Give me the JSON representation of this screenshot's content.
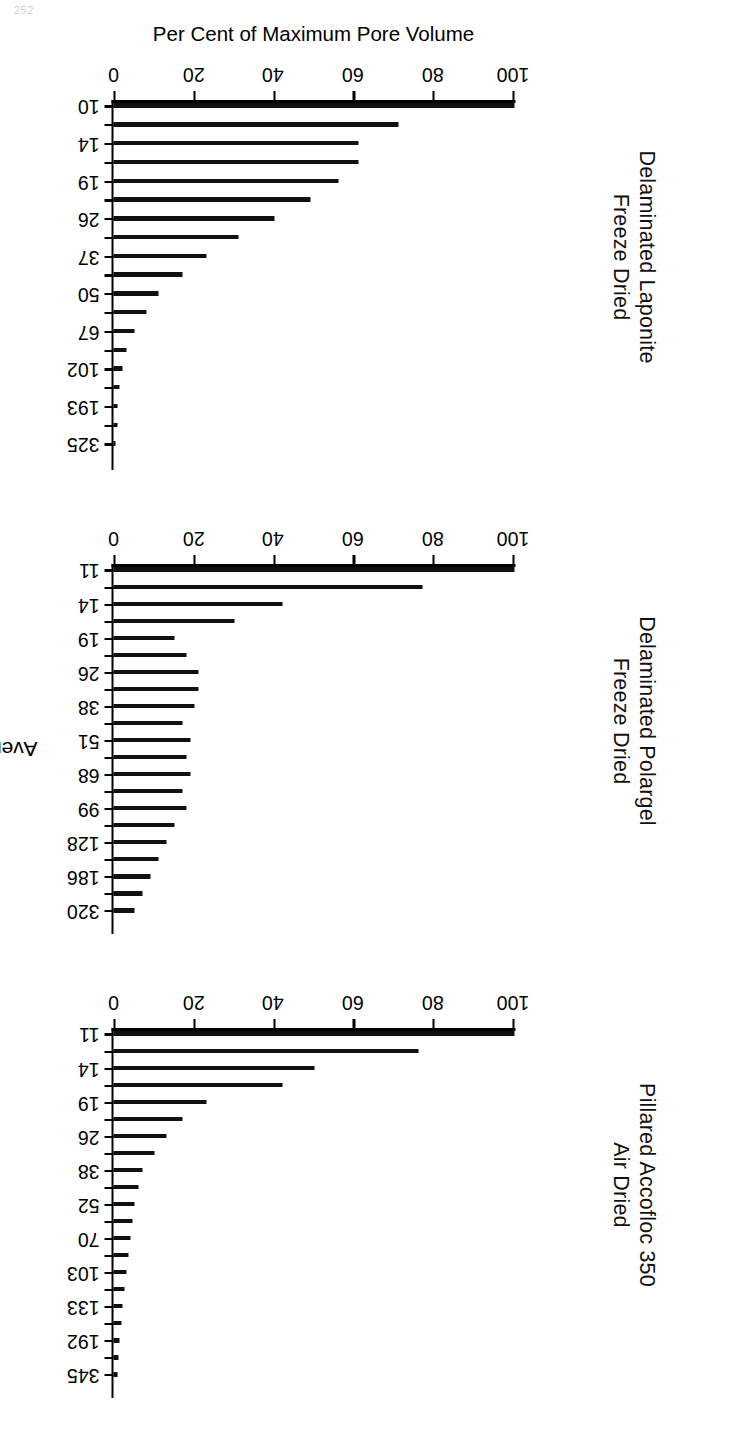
{
  "page": {
    "folio": "252"
  },
  "figure": {
    "x_axis_title": "Average Pore Diameter (Å)",
    "y_axis_title": "Per Cent of Maximum Pore Volume",
    "y_ticks": [
      "0",
      "20",
      "40",
      "60",
      "80",
      "100"
    ]
  },
  "chart_data": [
    {
      "type": "bar",
      "title": "Delaminated Laponite",
      "subtitle": "Freeze Dried",
      "xlabel": "Average Pore Diameter (Å)",
      "ylabel": "Per Cent of Maximum Pore Volume",
      "ylim": [
        0,
        100
      ],
      "yticks": [
        0,
        20,
        40,
        60,
        80,
        100
      ],
      "grid": false,
      "legend": "none",
      "orientation": "vertical-bars",
      "categories": [
        "10",
        "",
        "14",
        "",
        "19",
        "",
        "26",
        "",
        "37",
        "",
        "50",
        "",
        "67",
        "",
        "102",
        "",
        "193",
        "",
        "325"
      ],
      "tick_labels": [
        "10",
        "14",
        "19",
        "26",
        "37",
        "50",
        "67",
        "102",
        "193",
        "325"
      ],
      "tick_label_positions": [
        0,
        2,
        4,
        6,
        8,
        10,
        12,
        14,
        16,
        18
      ],
      "values": [
        100,
        71,
        61,
        61,
        56,
        49,
        40,
        31,
        23,
        17,
        11,
        8,
        5,
        3,
        2,
        1.5,
        1,
        1,
        0.5
      ]
    },
    {
      "type": "bar",
      "title": "Delaminated Polargel",
      "subtitle": "Freeze Dried",
      "xlabel": "Average Pore Diameter (Å)",
      "ylabel": "Per Cent of Maximum Pore Volume",
      "ylim": [
        0,
        100
      ],
      "yticks": [
        0,
        20,
        40,
        60,
        80,
        100
      ],
      "grid": false,
      "legend": "none",
      "orientation": "vertical-bars",
      "categories": [
        "11",
        "",
        "14",
        "",
        "19",
        "",
        "26",
        "",
        "38",
        "",
        "51",
        "",
        "68",
        "",
        "99",
        "",
        "128",
        "",
        "186",
        "",
        "320"
      ],
      "tick_labels": [
        "11",
        "14",
        "19",
        "26",
        "38",
        "51",
        "68",
        "99",
        "128",
        "186",
        "320"
      ],
      "tick_label_positions": [
        0,
        2,
        4,
        6,
        8,
        10,
        12,
        14,
        16,
        18,
        20
      ],
      "values": [
        100,
        77,
        42,
        30,
        15,
        18,
        21,
        21,
        20,
        17,
        19,
        18,
        19,
        17,
        18,
        15,
        13,
        11,
        9,
        7,
        5
      ]
    },
    {
      "type": "bar",
      "title": "Pillared Accofloc 350",
      "subtitle": "Air Dried",
      "xlabel": "Average Pore Diameter (Å)",
      "ylabel": "Per Cent of Maximum Pore Volume",
      "ylim": [
        0,
        100
      ],
      "yticks": [
        0,
        20,
        40,
        60,
        80,
        100
      ],
      "grid": false,
      "legend": "none",
      "orientation": "vertical-bars",
      "categories": [
        "11",
        "",
        "14",
        "",
        "19",
        "",
        "26",
        "",
        "38",
        "",
        "52",
        "",
        "70",
        "",
        "103",
        "",
        "133",
        "",
        "192",
        "",
        "345"
      ],
      "tick_labels": [
        "11",
        "14",
        "19",
        "26",
        "38",
        "52",
        "70",
        "103",
        "133",
        "192",
        "345"
      ],
      "tick_label_positions": [
        0,
        2,
        4,
        6,
        8,
        10,
        12,
        14,
        16,
        18,
        20
      ],
      "values": [
        100,
        76,
        50,
        42,
        23,
        17,
        13,
        10,
        7,
        6,
        5,
        4.5,
        4,
        3.5,
        3,
        2.5,
        2,
        1.8,
        1.5,
        1.2,
        1
      ]
    }
  ]
}
